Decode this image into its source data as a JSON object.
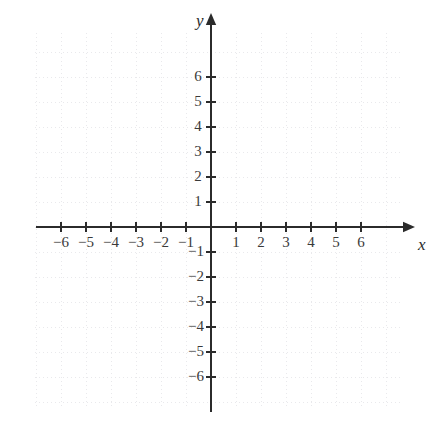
{
  "figure": {
    "kind": "cartesian-coordinate-plane",
    "background_color": "#ffffff",
    "axis_color": "#2b2b2b",
    "grid_color": "#e9e9ec",
    "label_color": "#3a3a3a"
  },
  "axes": {
    "x_axis_label": "x",
    "y_axis_label": "y",
    "x_label_position": {
      "x": 418,
      "y": 236
    },
    "y_label_position": {
      "x": 196,
      "y": 12
    }
  },
  "chart_data": {
    "type": "scatter",
    "title": "",
    "subtitle": "",
    "xlabel": "x",
    "ylabel": "y",
    "xlim": [
      -7,
      7
    ],
    "ylim": [
      -7,
      7
    ],
    "xticks": [
      -6,
      -5,
      -4,
      -3,
      -2,
      -1,
      1,
      2,
      3,
      4,
      5,
      6
    ],
    "yticks": [
      6,
      5,
      4,
      3,
      2,
      1,
      -1,
      -2,
      -3,
      -4,
      -5,
      -6
    ],
    "xtick_labels": [
      "−6",
      "−5",
      "−4",
      "−3",
      "−2",
      "−1",
      "1",
      "2",
      "3",
      "4",
      "5",
      "6"
    ],
    "ytick_labels": [
      "6",
      "5",
      "4",
      "3",
      "2",
      "1",
      "−1",
      "−2",
      "−3",
      "−4",
      "−5",
      "−6"
    ],
    "grid": true,
    "grid_style": "dotted",
    "legend": null,
    "series": [],
    "x": [],
    "values": [],
    "annotations": []
  },
  "geometry": {
    "origin_px": {
      "x": 211,
      "y": 227
    },
    "unit_px": 25,
    "x_axis_start_px": 36,
    "x_axis_end_px": 415,
    "y_axis_top_px": 13,
    "y_axis_bottom_px": 412,
    "grid_left_px": 35,
    "grid_right_px": 400,
    "grid_top_px": 33,
    "grid_bottom_px": 408,
    "tick_half_len_px": 5
  },
  "x_tick_labels": [
    {
      "text": "−6",
      "cx": 61,
      "cy": 243
    },
    {
      "text": "−5",
      "cx": 86,
      "cy": 243
    },
    {
      "text": "−4",
      "cx": 111,
      "cy": 243
    },
    {
      "text": "−3",
      "cx": 136,
      "cy": 243
    },
    {
      "text": "−2",
      "cx": 161,
      "cy": 243
    },
    {
      "text": "−1",
      "cx": 186,
      "cy": 243
    },
    {
      "text": "1",
      "cx": 236,
      "cy": 243
    },
    {
      "text": "2",
      "cx": 261,
      "cy": 243
    },
    {
      "text": "3",
      "cx": 286,
      "cy": 243
    },
    {
      "text": "4",
      "cx": 311,
      "cy": 243
    },
    {
      "text": "5",
      "cx": 336,
      "cy": 243
    },
    {
      "text": "6",
      "cx": 361,
      "cy": 243
    }
  ],
  "y_tick_labels": [
    {
      "text": "6",
      "cx": 198,
      "cy": 77
    },
    {
      "text": "5",
      "cx": 198,
      "cy": 102
    },
    {
      "text": "4",
      "cx": 198,
      "cy": 127
    },
    {
      "text": "3",
      "cx": 198,
      "cy": 152
    },
    {
      "text": "2",
      "cx": 198,
      "cy": 177
    },
    {
      "text": "1",
      "cx": 198,
      "cy": 202
    },
    {
      "text": "−1",
      "cx": 196,
      "cy": 252
    },
    {
      "text": "−2",
      "cx": 196,
      "cy": 277
    },
    {
      "text": "−3",
      "cx": 196,
      "cy": 302
    },
    {
      "text": "−4",
      "cx": 196,
      "cy": 327
    },
    {
      "text": "−5",
      "cx": 196,
      "cy": 352
    },
    {
      "text": "−6",
      "cx": 196,
      "cy": 377
    }
  ]
}
